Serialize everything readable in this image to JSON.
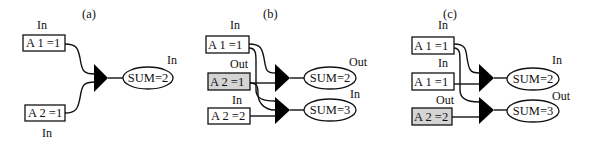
{
  "panels": [
    {
      "id": "a",
      "label": "(a)",
      "inputs": [
        {
          "text": "A 1  =1",
          "tag": "In",
          "highlighted": false
        },
        {
          "text": "A 2 =1",
          "tag": "In",
          "highlighted": false
        }
      ],
      "outputs": [
        {
          "text": "SUM=2",
          "tag": "In"
        }
      ]
    },
    {
      "id": "b",
      "label": "(b)",
      "inputs": [
        {
          "text": "A 1 =1",
          "tag": "In",
          "highlighted": false
        },
        {
          "text": "A 2  =1",
          "tag": "Out",
          "highlighted": true
        },
        {
          "text": "A 2 =2",
          "tag": "In",
          "highlighted": false
        }
      ],
      "outputs": [
        {
          "text": "SUM=2",
          "tag": "Out"
        },
        {
          "text": "SUM=3",
          "tag": "In"
        }
      ]
    },
    {
      "id": "c",
      "label": "(c)",
      "inputs": [
        {
          "text": "A 1  =1",
          "tag": "In",
          "highlighted": false
        },
        {
          "text": "A 1 =1",
          "tag": "In",
          "highlighted": false
        },
        {
          "text": "A 2 =2",
          "tag": "Out",
          "highlighted": true
        }
      ],
      "outputs": [
        {
          "text": "SUM=2",
          "tag": "In"
        },
        {
          "text": "SUM=3",
          "tag": "Out"
        }
      ]
    }
  ],
  "colors": {
    "highlight_fill": "#d4d4d4",
    "stroke": "#111111"
  }
}
